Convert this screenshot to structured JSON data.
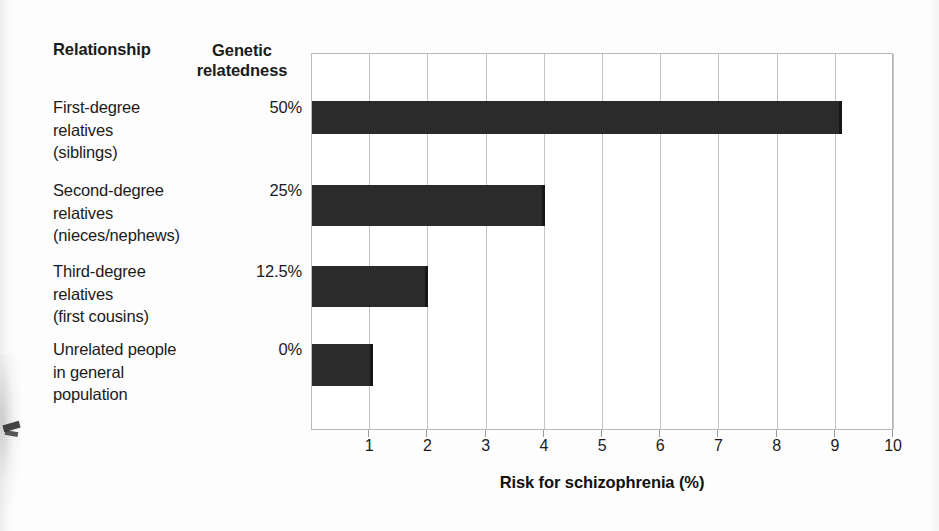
{
  "table": {
    "header_relationship": "Relationship",
    "header_genetic_line1": "Genetic",
    "header_genetic_line2": "relatedness",
    "rows": [
      {
        "label_line1": "First-degree",
        "label_line2": "relatives",
        "label_line3": "(siblings)",
        "relatedness": "50%"
      },
      {
        "label_line1": "Second-degree",
        "label_line2": "relatives",
        "label_line3": "(nieces/nephews)",
        "relatedness": "25%"
      },
      {
        "label_line1": "Third-degree",
        "label_line2": "relatives",
        "label_line3": "(first cousins)",
        "relatedness": "12.5%"
      },
      {
        "label_line1": "Unrelated people",
        "label_line2": "in general",
        "label_line3": "population",
        "relatedness": "0%"
      }
    ]
  },
  "chart_data": {
    "type": "bar",
    "orientation": "horizontal",
    "title": "",
    "xlabel": "Risk for schizophrenia (%)",
    "ylabel": "",
    "xlim": [
      0,
      10
    ],
    "xticks": [
      1,
      2,
      3,
      4,
      5,
      6,
      7,
      8,
      9,
      10
    ],
    "xticklabels": [
      "1",
      "2",
      "3",
      "4",
      "5",
      "6",
      "7",
      "8",
      "9",
      "10"
    ],
    "grid": true,
    "grid_axis": "x",
    "legend": false,
    "bar_color": "#2b2b2b",
    "categories": [
      "First-degree relatives (siblings)",
      "Second-degree relatives (nieces/nephews)",
      "Third-degree relatives (first cousins)",
      "Unrelated people in general population"
    ],
    "genetic_relatedness": [
      "50%",
      "25%",
      "12.5%",
      "0%"
    ],
    "values": [
      9.1,
      4.0,
      2.0,
      1.05
    ]
  },
  "colors": {
    "bar": "#2b2b2b",
    "grid": "#c3c3c3",
    "axis": "#b9b9b9",
    "text": "#1b1b1b",
    "background": "#fdfdfd"
  }
}
